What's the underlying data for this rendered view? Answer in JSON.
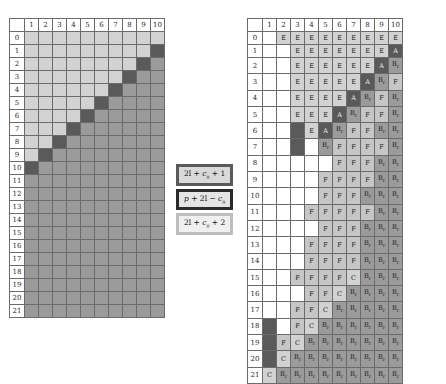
{
  "figure": {
    "caption": ""
  },
  "left_grid": {
    "name": "left-matrix",
    "col_headers": [
      "1",
      "2",
      "3",
      "4",
      "5",
      "6",
      "7",
      "8",
      "9",
      "10"
    ],
    "row_headers": [
      "0",
      "1",
      "2",
      "3",
      "4",
      "5",
      "6",
      "7",
      "8",
      "9",
      "10",
      "11",
      "12",
      "13",
      "14",
      "15",
      "16",
      "17",
      "18",
      "19",
      "20",
      "21"
    ],
    "corner_label": "",
    "shades": {
      "light": "#d2d2d2",
      "medium": "#9b9b9b",
      "dark": "#5a5a5a",
      "white": "#ffffff"
    },
    "rows": [
      [
        "l1",
        "l1",
        "l1",
        "l1",
        "l1",
        "l1",
        "l1",
        "l1",
        "l1",
        "l1"
      ],
      [
        "l1",
        "l1",
        "l1",
        "l1",
        "l1",
        "l1",
        "l1",
        "l1",
        "l1",
        "dark"
      ],
      [
        "l1",
        "l1",
        "l1",
        "l1",
        "l1",
        "l1",
        "l1",
        "l1",
        "dark",
        "mid"
      ],
      [
        "l1",
        "l1",
        "l1",
        "l1",
        "l1",
        "l1",
        "l1",
        "dark",
        "mid",
        "mid"
      ],
      [
        "l1",
        "l1",
        "l1",
        "l1",
        "l1",
        "l1",
        "dark",
        "mid",
        "mid",
        "mid"
      ],
      [
        "l1",
        "l1",
        "l1",
        "l1",
        "l1",
        "dark",
        "mid",
        "mid",
        "mid",
        "mid"
      ],
      [
        "l1",
        "l1",
        "l1",
        "l1",
        "dark",
        "mid",
        "mid",
        "mid",
        "mid",
        "mid"
      ],
      [
        "l1",
        "l1",
        "l1",
        "dark",
        "mid",
        "mid",
        "mid",
        "mid",
        "mid",
        "mid"
      ],
      [
        "l1",
        "l1",
        "dark",
        "mid",
        "mid",
        "mid",
        "mid",
        "mid",
        "mid",
        "mid"
      ],
      [
        "l1",
        "dark",
        "mid",
        "mid",
        "mid",
        "mid",
        "mid",
        "mid",
        "mid",
        "mid"
      ],
      [
        "dark",
        "mid",
        "mid",
        "mid",
        "mid",
        "mid",
        "mid",
        "mid",
        "mid",
        "mid"
      ],
      [
        "mid",
        "mid",
        "mid",
        "mid",
        "mid",
        "mid",
        "mid",
        "mid",
        "mid",
        "mid"
      ],
      [
        "mid",
        "mid",
        "mid",
        "mid",
        "mid",
        "mid",
        "mid",
        "mid",
        "mid",
        "mid"
      ],
      [
        "mid",
        "mid",
        "mid",
        "mid",
        "mid",
        "mid",
        "mid",
        "mid",
        "mid",
        "mid"
      ],
      [
        "mid",
        "mid",
        "mid",
        "mid",
        "mid",
        "mid",
        "mid",
        "mid",
        "mid",
        "mid"
      ],
      [
        "mid",
        "mid",
        "mid",
        "mid",
        "mid",
        "mid",
        "mid",
        "mid",
        "mid",
        "mid"
      ],
      [
        "mid",
        "mid",
        "mid",
        "mid",
        "mid",
        "mid",
        "mid",
        "mid",
        "mid",
        "mid"
      ],
      [
        "mid",
        "mid",
        "mid",
        "mid",
        "mid",
        "mid",
        "mid",
        "mid",
        "mid",
        "mid"
      ],
      [
        "mid",
        "mid",
        "mid",
        "mid",
        "mid",
        "mid",
        "mid",
        "mid",
        "mid",
        "mid"
      ],
      [
        "mid",
        "mid",
        "mid",
        "mid",
        "mid",
        "mid",
        "mid",
        "mid",
        "mid",
        "mid"
      ],
      [
        "mid",
        "mid",
        "mid",
        "mid",
        "mid",
        "mid",
        "mid",
        "mid",
        "mid",
        "mid"
      ],
      [
        "mid",
        "mid",
        "mid",
        "mid",
        "mid",
        "mid",
        "mid",
        "mid",
        "mid",
        "mid"
      ]
    ]
  },
  "right_grid": {
    "name": "right-matrix",
    "col_headers": [
      "1",
      "2",
      "3",
      "4",
      "5",
      "6",
      "7",
      "8",
      "9",
      "10"
    ],
    "row_headers": [
      "0",
      "1",
      "2",
      "3",
      "4",
      "5",
      "6",
      "7",
      "8",
      "9",
      "10",
      "11",
      "12",
      "13",
      "14",
      "15",
      "16",
      "17",
      "18",
      "19",
      "20",
      "21"
    ],
    "corner_label": "",
    "labels": {
      "E": "E",
      "A": "A",
      "B": "B",
      "B_sub": "r",
      "F": "F",
      "C": "C"
    },
    "rows": [
      [
        {
          "t": "",
          "s": "white"
        },
        {
          "t": "E",
          "s": "l1"
        },
        {
          "t": "E",
          "s": "l1"
        },
        {
          "t": "E",
          "s": "l1"
        },
        {
          "t": "E",
          "s": "l1"
        },
        {
          "t": "E",
          "s": "l1"
        },
        {
          "t": "E",
          "s": "l1"
        },
        {
          "t": "E",
          "s": "l1"
        },
        {
          "t": "E",
          "s": "l1"
        },
        {
          "t": "E",
          "s": "l1"
        }
      ],
      [
        {
          "t": "",
          "s": "white"
        },
        {
          "t": "",
          "s": "white"
        },
        {
          "t": "E",
          "s": "l1"
        },
        {
          "t": "E",
          "s": "l1"
        },
        {
          "t": "E",
          "s": "l1"
        },
        {
          "t": "E",
          "s": "l1"
        },
        {
          "t": "E",
          "s": "l1"
        },
        {
          "t": "E",
          "s": "l1"
        },
        {
          "t": "E",
          "s": "l1"
        },
        {
          "t": "A",
          "s": "dark"
        }
      ],
      [
        {
          "t": "",
          "s": "white"
        },
        {
          "t": "",
          "s": "white"
        },
        {
          "t": "E",
          "s": "l1"
        },
        {
          "t": "E",
          "s": "l1"
        },
        {
          "t": "E",
          "s": "l1"
        },
        {
          "t": "E",
          "s": "l1"
        },
        {
          "t": "E",
          "s": "l1"
        },
        {
          "t": "E",
          "s": "l1"
        },
        {
          "t": "A",
          "s": "dark"
        },
        {
          "t": "Br",
          "s": "mid"
        }
      ],
      [
        {
          "t": "",
          "s": "white"
        },
        {
          "t": "",
          "s": "white"
        },
        {
          "t": "E",
          "s": "l1"
        },
        {
          "t": "E",
          "s": "l1"
        },
        {
          "t": "E",
          "s": "l1"
        },
        {
          "t": "E",
          "s": "l1"
        },
        {
          "t": "E",
          "s": "l1"
        },
        {
          "t": "A",
          "s": "dark"
        },
        {
          "t": "Br",
          "s": "mid"
        },
        {
          "t": "F",
          "s": "l2"
        }
      ],
      [
        {
          "t": "",
          "s": "white"
        },
        {
          "t": "",
          "s": "white"
        },
        {
          "t": "E",
          "s": "l1"
        },
        {
          "t": "E",
          "s": "l1"
        },
        {
          "t": "E",
          "s": "l1"
        },
        {
          "t": "E",
          "s": "l1"
        },
        {
          "t": "A",
          "s": "dark"
        },
        {
          "t": "Br",
          "s": "mid"
        },
        {
          "t": "F",
          "s": "l2"
        },
        {
          "t": "Br",
          "s": "mid"
        }
      ],
      [
        {
          "t": "",
          "s": "white"
        },
        {
          "t": "",
          "s": "white"
        },
        {
          "t": "E",
          "s": "l1"
        },
        {
          "t": "E",
          "s": "l1"
        },
        {
          "t": "E",
          "s": "l1"
        },
        {
          "t": "A",
          "s": "dark"
        },
        {
          "t": "Br",
          "s": "mid"
        },
        {
          "t": "F",
          "s": "l2"
        },
        {
          "t": "F",
          "s": "l2"
        },
        {
          "t": "Br",
          "s": "mid"
        }
      ],
      [
        {
          "t": "",
          "s": "white"
        },
        {
          "t": "",
          "s": "white"
        },
        {
          "t": "",
          "s": "dark"
        },
        {
          "t": "E",
          "s": "l1"
        },
        {
          "t": "A",
          "s": "dark"
        },
        {
          "t": "Br",
          "s": "mid"
        },
        {
          "t": "F",
          "s": "l2"
        },
        {
          "t": "F",
          "s": "l2"
        },
        {
          "t": "Br",
          "s": "mid"
        },
        {
          "t": "Br",
          "s": "mid"
        }
      ],
      [
        {
          "t": "",
          "s": "white"
        },
        {
          "t": "",
          "s": "white"
        },
        {
          "t": "",
          "s": "dark"
        },
        {
          "t": "",
          "s": "white"
        },
        {
          "t": "Br",
          "s": "mid"
        },
        {
          "t": "F",
          "s": "l2"
        },
        {
          "t": "F",
          "s": "l2"
        },
        {
          "t": "F",
          "s": "l2"
        },
        {
          "t": "F",
          "s": "l2"
        },
        {
          "t": "Br",
          "s": "mid"
        }
      ],
      [
        {
          "t": "",
          "s": "white"
        },
        {
          "t": "",
          "s": "white"
        },
        {
          "t": "",
          "s": "white"
        },
        {
          "t": "",
          "s": "white"
        },
        {
          "t": "",
          "s": "white"
        },
        {
          "t": "F",
          "s": "l2"
        },
        {
          "t": "F",
          "s": "l2"
        },
        {
          "t": "F",
          "s": "l2"
        },
        {
          "t": "Br",
          "s": "mid"
        },
        {
          "t": "Br",
          "s": "mid"
        }
      ],
      [
        {
          "t": "",
          "s": "white"
        },
        {
          "t": "",
          "s": "white"
        },
        {
          "t": "",
          "s": "white"
        },
        {
          "t": "",
          "s": "white"
        },
        {
          "t": "F",
          "s": "l2"
        },
        {
          "t": "F",
          "s": "l2"
        },
        {
          "t": "F",
          "s": "l2"
        },
        {
          "t": "F",
          "s": "l2"
        },
        {
          "t": "Br",
          "s": "mid"
        },
        {
          "t": "Br",
          "s": "mid"
        }
      ],
      [
        {
          "t": "",
          "s": "white"
        },
        {
          "t": "",
          "s": "white"
        },
        {
          "t": "",
          "s": "white"
        },
        {
          "t": "",
          "s": "white"
        },
        {
          "t": "F",
          "s": "l2"
        },
        {
          "t": "F",
          "s": "l2"
        },
        {
          "t": "F",
          "s": "l2"
        },
        {
          "t": "Br",
          "s": "mid"
        },
        {
          "t": "Br",
          "s": "mid"
        },
        {
          "t": "Br",
          "s": "mid"
        }
      ],
      [
        {
          "t": "",
          "s": "white"
        },
        {
          "t": "",
          "s": "white"
        },
        {
          "t": "",
          "s": "white"
        },
        {
          "t": "F",
          "s": "l2"
        },
        {
          "t": "F",
          "s": "l2"
        },
        {
          "t": "F",
          "s": "l2"
        },
        {
          "t": "F",
          "s": "l2"
        },
        {
          "t": "F",
          "s": "l2"
        },
        {
          "t": "Br",
          "s": "mid"
        },
        {
          "t": "Br",
          "s": "mid"
        }
      ],
      [
        {
          "t": "",
          "s": "white"
        },
        {
          "t": "",
          "s": "white"
        },
        {
          "t": "",
          "s": "white"
        },
        {
          "t": "",
          "s": "white"
        },
        {
          "t": "F",
          "s": "l2"
        },
        {
          "t": "F",
          "s": "l2"
        },
        {
          "t": "F",
          "s": "l2"
        },
        {
          "t": "Br",
          "s": "mid"
        },
        {
          "t": "Br",
          "s": "mid"
        },
        {
          "t": "Br",
          "s": "mid"
        }
      ],
      [
        {
          "t": "",
          "s": "white"
        },
        {
          "t": "",
          "s": "white"
        },
        {
          "t": "",
          "s": "white"
        },
        {
          "t": "F",
          "s": "l2"
        },
        {
          "t": "F",
          "s": "l2"
        },
        {
          "t": "F",
          "s": "l2"
        },
        {
          "t": "F",
          "s": "l2"
        },
        {
          "t": "Br",
          "s": "mid"
        },
        {
          "t": "Br",
          "s": "mid"
        },
        {
          "t": "Br",
          "s": "mid"
        }
      ],
      [
        {
          "t": "",
          "s": "white"
        },
        {
          "t": "",
          "s": "white"
        },
        {
          "t": "",
          "s": "white"
        },
        {
          "t": "F",
          "s": "l2"
        },
        {
          "t": "F",
          "s": "l2"
        },
        {
          "t": "F",
          "s": "l2"
        },
        {
          "t": "F",
          "s": "l2"
        },
        {
          "t": "Br",
          "s": "mid"
        },
        {
          "t": "Br",
          "s": "mid"
        },
        {
          "t": "Br",
          "s": "mid"
        }
      ],
      [
        {
          "t": "",
          "s": "white"
        },
        {
          "t": "",
          "s": "white"
        },
        {
          "t": "F",
          "s": "l2"
        },
        {
          "t": "F",
          "s": "l2"
        },
        {
          "t": "F",
          "s": "l2"
        },
        {
          "t": "F",
          "s": "l2"
        },
        {
          "t": "C",
          "s": "l1"
        },
        {
          "t": "Br",
          "s": "mid"
        },
        {
          "t": "Br",
          "s": "mid"
        },
        {
          "t": "Br",
          "s": "mid"
        }
      ],
      [
        {
          "t": "",
          "s": "white"
        },
        {
          "t": "",
          "s": "white"
        },
        {
          "t": "",
          "s": "white"
        },
        {
          "t": "F",
          "s": "l2"
        },
        {
          "t": "F",
          "s": "l2"
        },
        {
          "t": "C",
          "s": "l1"
        },
        {
          "t": "Br",
          "s": "mid"
        },
        {
          "t": "Br",
          "s": "mid"
        },
        {
          "t": "Br",
          "s": "mid"
        },
        {
          "t": "Br",
          "s": "mid"
        }
      ],
      [
        {
          "t": "",
          "s": "white"
        },
        {
          "t": "",
          "s": "white"
        },
        {
          "t": "F",
          "s": "l2"
        },
        {
          "t": "F",
          "s": "l2"
        },
        {
          "t": "C",
          "s": "l1"
        },
        {
          "t": "Br",
          "s": "mid"
        },
        {
          "t": "Br",
          "s": "mid"
        },
        {
          "t": "Br",
          "s": "mid"
        },
        {
          "t": "Br",
          "s": "mid"
        },
        {
          "t": "Br",
          "s": "mid"
        }
      ],
      [
        {
          "t": "",
          "s": "dark"
        },
        {
          "t": "",
          "s": "white"
        },
        {
          "t": "F",
          "s": "l2"
        },
        {
          "t": "C",
          "s": "l1"
        },
        {
          "t": "Br",
          "s": "mid"
        },
        {
          "t": "Br",
          "s": "mid"
        },
        {
          "t": "Br",
          "s": "mid"
        },
        {
          "t": "Br",
          "s": "mid"
        },
        {
          "t": "Br",
          "s": "mid"
        },
        {
          "t": "Br",
          "s": "mid"
        }
      ],
      [
        {
          "t": "",
          "s": "dark"
        },
        {
          "t": "F",
          "s": "l2"
        },
        {
          "t": "C",
          "s": "l1"
        },
        {
          "t": "Br",
          "s": "mid"
        },
        {
          "t": "Br",
          "s": "mid"
        },
        {
          "t": "Br",
          "s": "mid"
        },
        {
          "t": "Br",
          "s": "mid"
        },
        {
          "t": "Br",
          "s": "mid"
        },
        {
          "t": "Br",
          "s": "mid"
        },
        {
          "t": "Br",
          "s": "mid"
        }
      ],
      [
        {
          "t": "",
          "s": "dark"
        },
        {
          "t": "C",
          "s": "l1"
        },
        {
          "t": "Br",
          "s": "mid"
        },
        {
          "t": "Br",
          "s": "mid"
        },
        {
          "t": "Br",
          "s": "mid"
        },
        {
          "t": "Br",
          "s": "mid"
        },
        {
          "t": "Br",
          "s": "mid"
        },
        {
          "t": "Br",
          "s": "mid"
        },
        {
          "t": "Br",
          "s": "mid"
        },
        {
          "t": "Br",
          "s": "mid"
        }
      ],
      [
        {
          "t": "C",
          "s": "l1"
        },
        {
          "t": "Br",
          "s": "mid"
        },
        {
          "t": "Br",
          "s": "mid"
        },
        {
          "t": "Br",
          "s": "mid"
        },
        {
          "t": "Br",
          "s": "mid"
        },
        {
          "t": "Br",
          "s": "mid"
        },
        {
          "t": "Br",
          "s": "mid"
        },
        {
          "t": "Br",
          "s": "mid"
        },
        {
          "t": "Br",
          "s": "mid"
        },
        {
          "t": "Br",
          "s": "mid"
        }
      ]
    ]
  },
  "legend": {
    "items": [
      {
        "id": "legend-dark",
        "text": "2l + c0 + 1",
        "parts": [
          "2",
          "l",
          " + ",
          "c",
          "0",
          " + 1"
        ],
        "border_color": "#5a5a5a",
        "fill": "#d9d9d9"
      },
      {
        "id": "legend-medium",
        "text": "p + 2l − c0",
        "parts": [
          "p",
          " + 2",
          "l",
          " − ",
          "c",
          "0"
        ],
        "border_color": "#2b2b2b",
        "fill": "#e4e4e4"
      },
      {
        "id": "legend-light",
        "text": "2l + c0 + 2",
        "parts": [
          "2",
          "l",
          " + ",
          "c",
          "0",
          " + 2"
        ],
        "border_color": "#bdbdbd",
        "fill": "#f0f0f0"
      }
    ]
  }
}
